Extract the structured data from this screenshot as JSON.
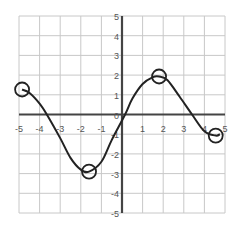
{
  "chart_data": {
    "type": "line",
    "title": "",
    "xlabel": "",
    "ylabel": "",
    "xlim": [
      -5,
      5
    ],
    "ylim": [
      -5,
      5
    ],
    "grid": true,
    "x_ticks": [
      "-5",
      "-4",
      "-3",
      "-2",
      "-1",
      "0",
      "1",
      "2",
      "3",
      "4",
      "5"
    ],
    "y_ticks": [
      "-5",
      "-4",
      "-3",
      "-2",
      "-1",
      "0",
      "1",
      "2",
      "3",
      "4",
      "5"
    ],
    "series": [
      {
        "name": "f(x)",
        "points": [
          [
            -4.85,
            1.27
          ],
          [
            -4.5,
            1.1
          ],
          [
            -4.0,
            0.55
          ],
          [
            -3.65,
            0.0
          ],
          [
            -3.0,
            -1.2
          ],
          [
            -2.5,
            -2.2
          ],
          [
            -2.0,
            -2.8
          ],
          [
            -1.6,
            -2.9
          ],
          [
            -1.0,
            -2.4
          ],
          [
            -0.5,
            -1.3
          ],
          [
            0.15,
            0.0
          ],
          [
            0.5,
            0.8
          ],
          [
            1.0,
            1.55
          ],
          [
            1.5,
            1.9
          ],
          [
            1.8,
            1.93
          ],
          [
            2.2,
            1.75
          ],
          [
            2.8,
            0.9
          ],
          [
            3.4,
            0.0
          ],
          [
            4.0,
            -0.85
          ],
          [
            4.55,
            -1.07
          ],
          [
            4.75,
            -1.0
          ]
        ]
      }
    ],
    "annotations": [
      {
        "type": "circle",
        "label": "left endpoint",
        "x": -4.85,
        "y": 1.27
      },
      {
        "type": "circle",
        "label": "local minimum",
        "x": -1.6,
        "y": -2.9
      },
      {
        "type": "circle",
        "label": "local maximum",
        "x": 1.8,
        "y": 1.93
      },
      {
        "type": "circle",
        "label": "right endpoint",
        "x": 4.55,
        "y": -1.07
      }
    ],
    "colors": {
      "grid": "#c8c8c8",
      "axis": "#444444",
      "curve": "#222222",
      "label": "#555555"
    }
  }
}
